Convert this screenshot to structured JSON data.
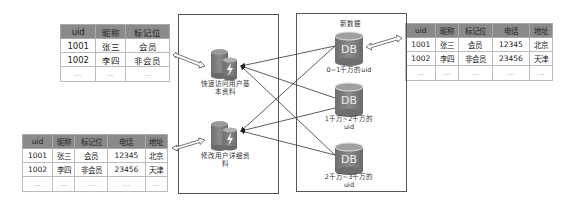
{
  "table_top_left": {
    "headers": [
      "uid",
      "昵称",
      "标记位"
    ],
    "rows": [
      [
        "1001",
        "张三",
        "会员"
      ],
      [
        "1002",
        "李四",
        "非会员"
      ],
      [
        "...",
        "...",
        "..."
      ]
    ]
  },
  "table_bottom_left": {
    "headers": [
      "uid",
      "昵称",
      "标记位",
      "电话",
      "地址"
    ],
    "rows": [
      [
        "1001",
        "张三",
        "会员",
        "12345",
        "北京"
      ],
      [
        "1002",
        "李四",
        "非会员",
        "23456",
        "天津"
      ],
      [
        "...",
        "...",
        "...",
        "...",
        "..."
      ]
    ]
  },
  "table_right": {
    "headers": [
      "uid",
      "昵称",
      "标记位",
      "电话",
      "地址"
    ],
    "rows": [
      [
        "1001",
        "张三",
        "会员",
        "12345",
        "北京"
      ],
      [
        "1002",
        "李四",
        "非会员",
        "23456",
        "天津"
      ],
      [
        "...",
        "...",
        "...",
        "...",
        "..."
      ]
    ]
  },
  "left_box": {
    "cache_top_label": "快速访问用户基本资料",
    "cache_bottom_label": "修改用户详细资料"
  },
  "right_box": {
    "title": "新数据",
    "db_icon_text": "DB",
    "db1_label": "0~1千万的uid",
    "db2_label": "1千万~2千万的uid",
    "db3_label": "2千万~3千万的uid"
  },
  "colors": {
    "db_fill": "#7a7a7a",
    "header_fill": "#8a8a8a",
    "line": "#333333"
  }
}
